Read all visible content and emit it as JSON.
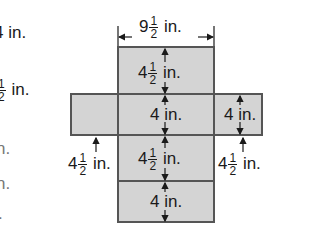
{
  "left_clipped_text": [
    {
      "text": "4 in.",
      "faded": false
    },
    {
      "frac": "1/2",
      "text": "in.",
      "faded": false
    },
    {
      "text": "n.",
      "faded": true
    },
    {
      "text": "n.",
      "faded": true
    },
    {
      "text": ".",
      "faded": true
    }
  ],
  "net": {
    "fill_color": "#d4d4d4",
    "border_color": "#555555",
    "top_width_label": {
      "whole": "9",
      "num": "1",
      "den": "2",
      "unit": "in."
    },
    "faces": [
      {
        "name": "top-face",
        "label": {
          "whole": "4",
          "num": "1",
          "den": "2",
          "unit": "in."
        }
      },
      {
        "name": "left-face"
      },
      {
        "name": "center-face",
        "label": {
          "whole": "4",
          "unit": "in."
        }
      },
      {
        "name": "right-face",
        "label": {
          "whole": "4",
          "unit": "in."
        }
      },
      {
        "name": "lower-face",
        "label": {
          "whole": "4",
          "num": "1",
          "den": "2",
          "unit": "in."
        }
      },
      {
        "name": "bottom-face",
        "label": {
          "whole": "4",
          "unit": "in."
        }
      }
    ],
    "left_side_label": {
      "whole": "4",
      "num": "1",
      "den": "2",
      "unit": "in."
    },
    "right_side_label": {
      "whole": "4",
      "num": "1",
      "den": "2",
      "unit": "in."
    }
  }
}
